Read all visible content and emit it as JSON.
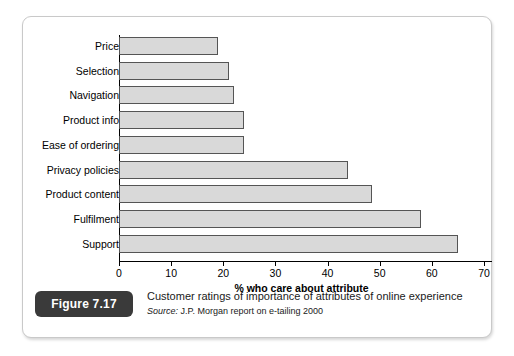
{
  "figure": {
    "badge_label": "Figure 7.17",
    "title": "Customer ratings of importance of attributes of online experience",
    "source_prefix": "Source:",
    "source_text": "J.P. Morgan report on e-tailing 2000"
  },
  "chart_data": {
    "type": "bar",
    "orientation": "horizontal",
    "title": "",
    "xlabel": "% who care about attribute",
    "ylabel": "",
    "xlim": [
      0,
      70
    ],
    "xticks": [
      0,
      10,
      20,
      30,
      40,
      50,
      60,
      70
    ],
    "xtick_labels": [
      "0",
      "10",
      "20",
      "30",
      "40",
      "50",
      "60",
      "70"
    ],
    "grid": false,
    "legend": false,
    "bar_fill_color": "#d9d9d9",
    "bar_edge_color": "#555555",
    "categories": [
      "Price",
      "Selection",
      "Navigation",
      "Product info",
      "Ease of ordering",
      "Privacy policies",
      "Product content",
      "Fulfilment",
      "Support"
    ],
    "values": [
      19,
      21,
      22,
      24,
      24,
      44,
      48.5,
      58,
      65
    ]
  }
}
